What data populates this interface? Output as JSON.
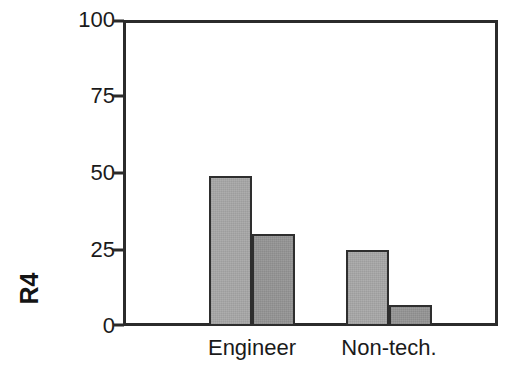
{
  "chart_data": {
    "type": "bar",
    "title": "",
    "subtitle": "",
    "xlabel": "",
    "ylabel": "R4",
    "categories": [
      "Engineer",
      "Non-tech."
    ],
    "series": [
      {
        "name": "series-1",
        "values": [
          49,
          25
        ],
        "color": "#a8a8a8"
      },
      {
        "name": "series-2",
        "values": [
          30,
          7
        ],
        "color": "#959595"
      }
    ],
    "ylim": [
      0,
      100
    ],
    "yticks": [
      0,
      25,
      50,
      75,
      100
    ],
    "ytick_labels": [
      "0",
      "25",
      "50",
      "75",
      "100"
    ],
    "grid": false,
    "legend": "none",
    "frame": "box",
    "bar_edge_color": "#2e2e2e",
    "axis_color": "#2b2b2b",
    "text_color": "#1a1a1a",
    "background": "#ffffff"
  },
  "axis": {
    "y_title": "R4",
    "ticks": [
      {
        "value": 100,
        "label": "100"
      },
      {
        "value": 75,
        "label": "75"
      },
      {
        "value": 50,
        "label": "50"
      },
      {
        "value": 25,
        "label": "25"
      },
      {
        "value": 0,
        "label": "0"
      }
    ]
  },
  "categories": [
    {
      "label": "Engineer"
    },
    {
      "label": "Non-tech."
    }
  ],
  "bars": [
    {
      "name": "engineer-series-1",
      "value": 49,
      "series": 0,
      "category": 0
    },
    {
      "name": "engineer-series-2",
      "value": 30,
      "series": 1,
      "category": 0
    },
    {
      "name": "nontech-series-1",
      "value": 25,
      "series": 0,
      "category": 1
    },
    {
      "name": "nontech-series-2",
      "value": 7,
      "series": 1,
      "category": 1
    }
  ]
}
